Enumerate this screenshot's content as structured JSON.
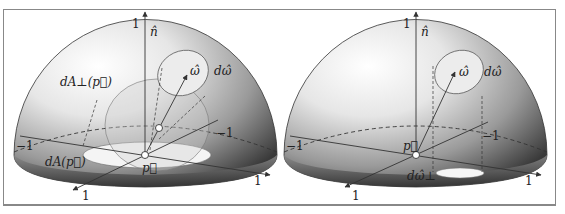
{
  "figure": {
    "panels": [
      {
        "id": "left",
        "title": "Projected area",
        "labels": {
          "normal": "n̂",
          "omega": "ω̂",
          "solid_angle": "dω̂",
          "projected_area": "dA⊥(p⃗)",
          "area": "dA(p⃗)",
          "point": "p⃗",
          "axis_top": "1",
          "axis_left": "−1",
          "axis_right_back": "−1",
          "axis_front_left": "1",
          "axis_front_right": "1"
        }
      },
      {
        "id": "right",
        "title": "Projected solid angle",
        "labels": {
          "normal": "n̂",
          "omega": "ω̂",
          "solid_angle": "dω̂",
          "projected_solid_angle": "dω̂⊥",
          "point": "p⃗",
          "axis_top": "1",
          "axis_left": "−1",
          "axis_right_back": "−1",
          "axis_front_left": "1",
          "axis_front_right": "1"
        }
      }
    ],
    "colors": {
      "hemisphere_dark": "#3a3a3a",
      "hemisphere_light": "#ffffff",
      "line": "#333333",
      "disc": "#f2f2f2",
      "border": "#888888"
    }
  }
}
